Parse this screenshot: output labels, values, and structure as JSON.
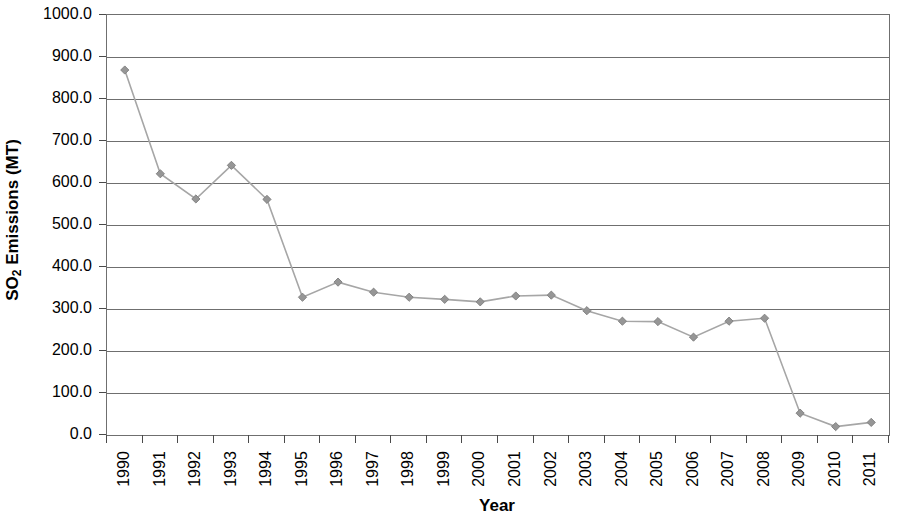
{
  "chart_data": {
    "type": "line",
    "title": "",
    "xlabel": "Year",
    "ylabel": "SO2 Emissions (MT)",
    "ylabel_parts": {
      "prefix": "SO",
      "subscript": "2",
      "suffix": " Emissions (MT)"
    },
    "categories": [
      "1990",
      "1991",
      "1992",
      "1993",
      "1994",
      "1995",
      "1996",
      "1997",
      "1998",
      "1999",
      "2000",
      "2001",
      "2002",
      "2003",
      "2004",
      "2005",
      "2006",
      "2007",
      "2008",
      "2009",
      "2010",
      "2011"
    ],
    "values": [
      869,
      622,
      562,
      642,
      561,
      328,
      364,
      340,
      328,
      323,
      317,
      331,
      333,
      296,
      271,
      270,
      233,
      271,
      278,
      52,
      20,
      30
    ],
    "ylim": [
      0,
      1000
    ],
    "y_ticks": [
      0,
      100,
      200,
      300,
      400,
      500,
      600,
      700,
      800,
      900,
      1000
    ],
    "y_tick_labels": [
      "0.0",
      "100.0",
      "200.0",
      "300.0",
      "400.0",
      "500.0",
      "600.0",
      "700.0",
      "800.0",
      "900.0",
      "1000.0"
    ],
    "grid": true,
    "grid_axis": "y",
    "legend": false,
    "legend_position": "none",
    "series": [
      {
        "name": "SO2 Emissions",
        "marker": "diamond",
        "line_color": "#a6a6a6",
        "marker_color": "#969696",
        "marker_edge_color": "#7d7d7d"
      }
    ],
    "colors": {
      "line": "#a6a6a6",
      "marker_fill": "#969696",
      "marker_edge": "#7d7d7d",
      "gridline": "#6f6f6f",
      "axis": "#6f6f6f",
      "text": "#000000",
      "background": "#ffffff"
    }
  }
}
